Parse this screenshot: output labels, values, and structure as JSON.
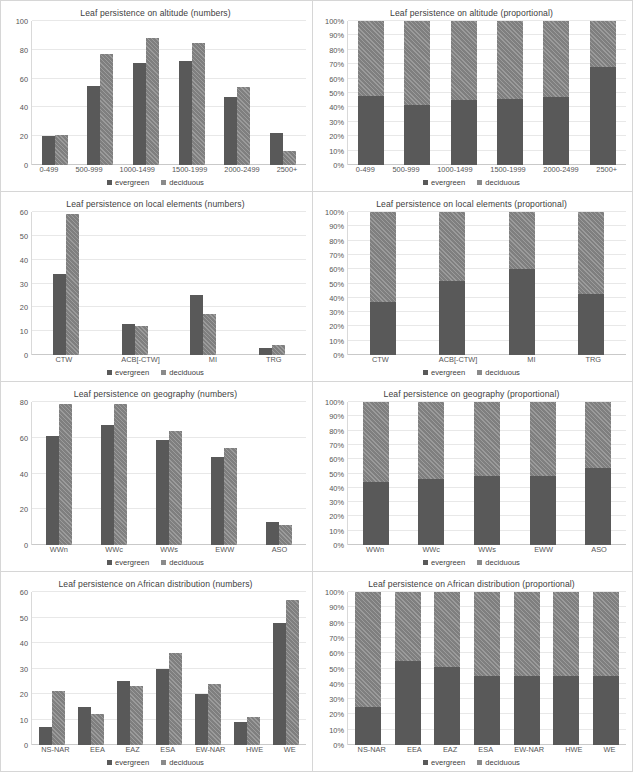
{
  "legend": {
    "evergreen": "evergreen",
    "deciduous": "deciduous"
  },
  "caption": "",
  "chart_data": [
    {
      "id": "altitude-numbers",
      "type": "bar",
      "title": "Leaf persistence on altitude (numbers)",
      "xlabel": "",
      "ylabel": "",
      "ylim": [
        0,
        100
      ],
      "yticks": [
        "0",
        "20",
        "40",
        "60",
        "80",
        "100"
      ],
      "grid": true,
      "legend_position": "bottom",
      "categories": [
        "0-499",
        "500-999",
        "1000-1499",
        "1500-1999",
        "2000-2499",
        "2500+"
      ],
      "series": [
        {
          "name": "evergreen",
          "values": [
            20,
            55,
            71,
            72,
            47,
            22
          ]
        },
        {
          "name": "deciduous",
          "values": [
            21,
            77,
            88,
            85,
            54,
            10
          ]
        }
      ]
    },
    {
      "id": "altitude-proportional",
      "type": "bar",
      "title": "Leaf persistence on altitude (proportional)",
      "xlabel": "",
      "ylabel": "",
      "ylim": [
        0,
        100
      ],
      "yticks": [
        "0%",
        "10%",
        "20%",
        "30%",
        "40%",
        "50%",
        "60%",
        "70%",
        "80%",
        "90%",
        "100%"
      ],
      "grid": true,
      "stacked": true,
      "legend_position": "bottom",
      "categories": [
        "0-499",
        "500-999",
        "1000-1499",
        "1500-1999",
        "2000-2499",
        "2500+"
      ],
      "series": [
        {
          "name": "evergreen",
          "values": [
            48,
            42,
            45,
            46,
            47,
            68
          ]
        },
        {
          "name": "deciduous",
          "values": [
            52,
            58,
            55,
            54,
            53,
            32
          ]
        }
      ]
    },
    {
      "id": "local-elements-numbers",
      "type": "bar",
      "title": "Leaf persistence on local elements (numbers)",
      "xlabel": "",
      "ylabel": "",
      "ylim": [
        0,
        60
      ],
      "yticks": [
        "0",
        "10",
        "20",
        "30",
        "40",
        "50",
        "60"
      ],
      "grid": true,
      "legend_position": "bottom",
      "categories": [
        "CTW",
        "ACB[-CTW]",
        "MI",
        "TRG"
      ],
      "series": [
        {
          "name": "evergreen",
          "values": [
            34,
            13,
            25,
            3
          ]
        },
        {
          "name": "deciduous",
          "values": [
            59,
            12,
            17,
            4
          ]
        }
      ]
    },
    {
      "id": "local-elements-proportional",
      "type": "bar",
      "title": "Leaf persistence on local elements (proportional)",
      "xlabel": "",
      "ylabel": "",
      "ylim": [
        0,
        100
      ],
      "yticks": [
        "0%",
        "10%",
        "20%",
        "30%",
        "40%",
        "50%",
        "60%",
        "70%",
        "80%",
        "90%",
        "100%"
      ],
      "grid": true,
      "stacked": true,
      "legend_position": "bottom",
      "categories": [
        "CTW",
        "ACB[-CTW]",
        "MI",
        "TRG"
      ],
      "series": [
        {
          "name": "evergreen",
          "values": [
            37,
            52,
            60,
            43
          ]
        },
        {
          "name": "deciduous",
          "values": [
            63,
            48,
            40,
            57
          ]
        }
      ]
    },
    {
      "id": "geography-numbers",
      "type": "bar",
      "title": "Leaf persistence on geography (numbers)",
      "xlabel": "",
      "ylabel": "",
      "ylim": [
        0,
        80
      ],
      "yticks": [
        "0",
        "20",
        "40",
        "60",
        "80"
      ],
      "grid": true,
      "legend_position": "bottom",
      "categories": [
        "WWn",
        "WWc",
        "WWs",
        "EWW",
        "ASO"
      ],
      "series": [
        {
          "name": "evergreen",
          "values": [
            61,
            67,
            59,
            49,
            13
          ]
        },
        {
          "name": "deciduous",
          "values": [
            79,
            79,
            64,
            54,
            11
          ]
        }
      ]
    },
    {
      "id": "geography-proportional",
      "type": "bar",
      "title": "Leaf persistence on geography (proportional)",
      "xlabel": "",
      "ylabel": "",
      "ylim": [
        0,
        100
      ],
      "yticks": [
        "0%",
        "10%",
        "20%",
        "30%",
        "40%",
        "50%",
        "60%",
        "70%",
        "80%",
        "90%",
        "100%"
      ],
      "grid": true,
      "stacked": true,
      "legend_position": "bottom",
      "categories": [
        "WWn",
        "WWc",
        "WWs",
        "EWW",
        "ASO"
      ],
      "series": [
        {
          "name": "evergreen",
          "values": [
            44,
            46,
            48,
            48,
            54
          ]
        },
        {
          "name": "deciduous",
          "values": [
            56,
            54,
            52,
            52,
            46
          ]
        }
      ]
    },
    {
      "id": "african-distribution-numbers",
      "type": "bar",
      "title": "Leaf persistence on African distribution (numbers)",
      "xlabel": "",
      "ylabel": "",
      "ylim": [
        0,
        60
      ],
      "yticks": [
        "0",
        "10",
        "20",
        "30",
        "40",
        "50",
        "60"
      ],
      "grid": true,
      "legend_position": "bottom",
      "categories": [
        "NS-NAR",
        "EEA",
        "EAZ",
        "ESA",
        "EW-NAR",
        "HWE",
        "WE"
      ],
      "series": [
        {
          "name": "evergreen",
          "values": [
            7,
            15,
            25,
            30,
            20,
            9,
            48
          ]
        },
        {
          "name": "deciduous",
          "values": [
            21,
            12,
            23,
            36,
            24,
            11,
            57
          ]
        }
      ]
    },
    {
      "id": "african-distribution-proportional",
      "type": "bar",
      "title": "Leaf persistence on African distribution (proportional)",
      "xlabel": "",
      "ylabel": "",
      "ylim": [
        0,
        100
      ],
      "yticks": [
        "0%",
        "10%",
        "20%",
        "30%",
        "40%",
        "50%",
        "60%",
        "70%",
        "80%",
        "90%",
        "100%"
      ],
      "grid": true,
      "stacked": true,
      "legend_position": "bottom",
      "categories": [
        "NS-NAR",
        "EEA",
        "EAZ",
        "ESA",
        "EW-NAR",
        "HWE",
        "WE"
      ],
      "series": [
        {
          "name": "evergreen",
          "values": [
            25,
            55,
            51,
            45,
            45,
            45,
            45
          ]
        },
        {
          "name": "deciduous",
          "values": [
            75,
            45,
            49,
            55,
            55,
            55,
            55
          ]
        }
      ]
    }
  ]
}
